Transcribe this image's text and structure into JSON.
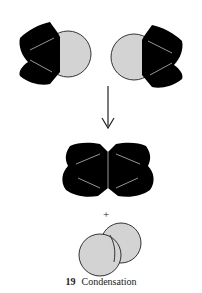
{
  "figure": {
    "number": "19",
    "caption": "Condensation",
    "plus_sign": "+"
  },
  "colors": {
    "molecule_body": "#000000",
    "leaving_group": "#d3d3d3",
    "outline": "#333333",
    "bond_line": "#bbbbbb"
  },
  "elements": {
    "reactant_left": "Molecule with black ring body and grey sphere on right",
    "reactant_right": "Molecule with grey sphere on left and black ring body",
    "arrow": "Downward reaction arrow",
    "product_dimer": "Joined black ring dimer",
    "byproduct": "Two fused grey spheres"
  }
}
